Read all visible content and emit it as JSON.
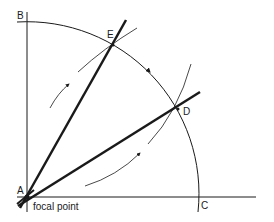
{
  "labels": {
    "A": "A",
    "B": "B",
    "C": "C",
    "D": "D",
    "E": "E",
    "focal": "focal point"
  },
  "colors": {
    "stroke": "#1a1a1a",
    "background": "#ffffff"
  }
}
